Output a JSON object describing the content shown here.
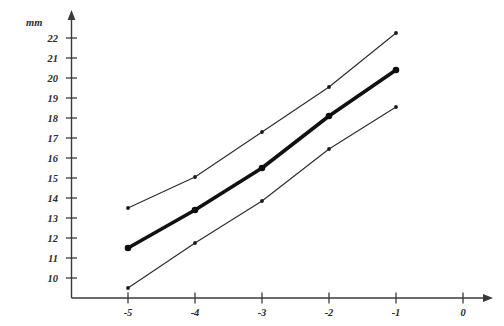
{
  "chart_data": {
    "type": "line",
    "title": "",
    "xlabel": "",
    "ylabel": "mm",
    "x": [
      -5,
      -4,
      -3,
      -2,
      -1
    ],
    "xticks": [
      "-5",
      "-4",
      "-3",
      "-2",
      "-1",
      "0"
    ],
    "xtick_values": [
      -5,
      -4,
      -3,
      -2,
      -1,
      0
    ],
    "yticks": [
      "10",
      "11",
      "12",
      "13",
      "14",
      "15",
      "16",
      "17",
      "18",
      "19",
      "20",
      "21",
      "22"
    ],
    "ytick_values": [
      10,
      11,
      12,
      13,
      14,
      15,
      16,
      17,
      18,
      19,
      20,
      21,
      22
    ],
    "xlim": [
      -5.6,
      0.45
    ],
    "ylim": [
      9.0,
      22.6
    ],
    "grid": false,
    "legend": "none",
    "series": [
      {
        "name": "upper-curve",
        "style": "thin",
        "values": [
          13.5,
          15.05,
          17.3,
          19.55,
          22.25
        ]
      },
      {
        "name": "middle-curve",
        "style": "thick",
        "values": [
          11.5,
          13.4,
          15.5,
          18.1,
          20.4
        ]
      },
      {
        "name": "lower-curve",
        "style": "thin",
        "values": [
          9.5,
          11.75,
          13.85,
          16.45,
          18.55
        ]
      }
    ]
  },
  "axes": {
    "y_unit_label": "mm",
    "x_axis_name": "x-axis",
    "y_axis_name": "y-axis"
  }
}
